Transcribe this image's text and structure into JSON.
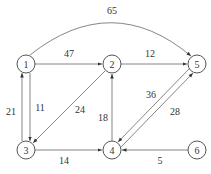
{
  "diagram": {
    "type": "directed-weighted-graph",
    "nodes": [
      {
        "id": "1",
        "label": "1",
        "x": 26,
        "y": 64
      },
      {
        "id": "2",
        "label": "2",
        "x": 112,
        "y": 64
      },
      {
        "id": "5",
        "label": "5",
        "x": 197,
        "y": 64
      },
      {
        "id": "3",
        "label": "3",
        "x": 26,
        "y": 150
      },
      {
        "id": "4",
        "label": "4",
        "x": 112,
        "y": 150
      },
      {
        "id": "6",
        "label": "6",
        "x": 197,
        "y": 150
      }
    ],
    "edges": [
      {
        "from": "1",
        "to": "5",
        "weight": "65"
      },
      {
        "from": "1",
        "to": "2",
        "weight": "47"
      },
      {
        "from": "2",
        "to": "5",
        "weight": "12"
      },
      {
        "from": "3",
        "to": "1",
        "weight": "21"
      },
      {
        "from": "1",
        "to": "3",
        "weight": "11"
      },
      {
        "from": "2",
        "to": "3",
        "weight": "24"
      },
      {
        "from": "4",
        "to": "2",
        "weight": "18"
      },
      {
        "from": "5",
        "to": "4",
        "weight": "36"
      },
      {
        "from": "4",
        "to": "5",
        "weight": "28"
      },
      {
        "from": "3",
        "to": "4",
        "weight": "14"
      },
      {
        "from": "6",
        "to": "4",
        "weight": "5"
      }
    ]
  }
}
